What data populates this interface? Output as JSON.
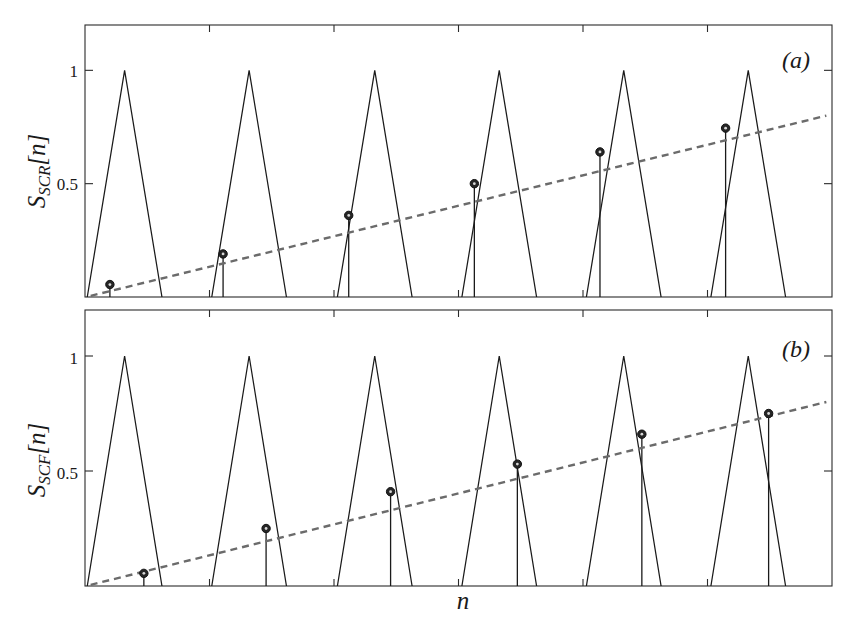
{
  "figure": {
    "background": "#ffffff",
    "line_color": "#1a1a1a",
    "trend_color": "#6b6b6b",
    "marker_color": "#262626",
    "xlabel": "n",
    "panels": [
      {
        "tag": "(a)",
        "ylabel_main": "S",
        "ylabel_sub": "SCR",
        "ylabel_tail": "[n]"
      },
      {
        "tag": "(b)",
        "ylabel_main": "S",
        "ylabel_sub": "SCF",
        "ylabel_tail": "[n]"
      }
    ]
  },
  "chart_data": [
    {
      "type": "line",
      "title": "",
      "panel_tag": "(a)",
      "xlabel": "n",
      "ylabel": "S_SCR[n]",
      "xlim": [
        0,
        6.6
      ],
      "ylim": [
        0,
        1.2
      ],
      "yticks": [
        0.5,
        1
      ],
      "ytick_labels": [
        "0.5",
        "1"
      ],
      "xticks": [
        1.1,
        2.2,
        3.3,
        4.4,
        5.5
      ],
      "xtick_labels": [
        "",
        "",
        "",
        "",
        ""
      ],
      "grid": false,
      "legend": "none",
      "series": [
        {
          "name": "triangular pulses",
          "kind": "triangles",
          "peak_value": 1.0,
          "peaks_x": [
            0.35,
            1.45,
            2.56,
            3.66,
            4.76,
            5.86
          ],
          "half_width": 0.33
        },
        {
          "name": "impulse samples",
          "kind": "stems",
          "x": [
            0.22,
            1.22,
            2.33,
            3.44,
            4.55,
            5.66
          ],
          "values": [
            0.055,
            0.19,
            0.36,
            0.5,
            0.64,
            0.745
          ]
        },
        {
          "name": "envelope trend",
          "kind": "dashed-line",
          "x": [
            0.05,
            6.55
          ],
          "values": [
            0.005,
            0.8
          ]
        }
      ]
    },
    {
      "type": "line",
      "title": "",
      "panel_tag": "(b)",
      "xlabel": "n",
      "ylabel": "S_SCF[n]",
      "xlim": [
        0,
        6.6
      ],
      "ylim": [
        0,
        1.2
      ],
      "yticks": [
        0.5,
        1
      ],
      "ytick_labels": [
        "0.5",
        "1"
      ],
      "xticks": [
        1.1,
        2.2,
        3.3,
        4.4,
        5.5
      ],
      "xtick_labels": [
        "",
        "",
        "",
        "",
        ""
      ],
      "grid": false,
      "legend": "none",
      "series": [
        {
          "name": "triangular pulses",
          "kind": "triangles",
          "peak_value": 1.0,
          "peaks_x": [
            0.35,
            1.45,
            2.56,
            3.66,
            4.76,
            5.86
          ],
          "half_width": 0.33
        },
        {
          "name": "impulse samples",
          "kind": "stems",
          "x": [
            0.52,
            1.6,
            2.7,
            3.82,
            4.92,
            6.04
          ],
          "values": [
            0.055,
            0.25,
            0.41,
            0.53,
            0.66,
            0.75
          ]
        },
        {
          "name": "envelope trend",
          "kind": "dashed-line",
          "x": [
            0.05,
            6.55
          ],
          "values": [
            0.005,
            0.8
          ]
        }
      ]
    }
  ]
}
